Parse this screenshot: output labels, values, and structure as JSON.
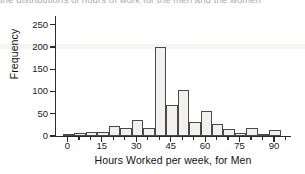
{
  "caption": "the distributions of hours of work for the men and the women",
  "chart_data": {
    "type": "bar",
    "title": "",
    "xlabel": "Hours Worked per week, for Men",
    "ylabel": "Frequency",
    "xlim": [
      -5,
      97
    ],
    "ylim": [
      0,
      265
    ],
    "grid": false,
    "legend": "none",
    "bin_width": 5,
    "x_ticks": [
      0,
      5,
      10,
      15,
      20,
      25,
      30,
      35,
      40,
      45,
      50,
      55,
      60,
      65,
      70,
      75,
      80,
      85,
      90,
      95
    ],
    "x_tick_labels": [
      "0",
      "15",
      "30",
      "45",
      "60",
      "75",
      "90"
    ],
    "x_major_ticks": [
      0,
      15,
      30,
      45,
      60,
      75,
      90
    ],
    "y_ticks": [
      0,
      50,
      100,
      150,
      200,
      250
    ],
    "y_tick_labels": [
      "0",
      "50",
      "100",
      "150",
      "200",
      "250"
    ],
    "bins": [
      {
        "start": -2,
        "end": 3,
        "value": 4
      },
      {
        "start": 3,
        "end": 8,
        "value": 7
      },
      {
        "start": 8,
        "end": 13,
        "value": 10
      },
      {
        "start": 13,
        "end": 18,
        "value": 10
      },
      {
        "start": 18,
        "end": 23,
        "value": 22
      },
      {
        "start": 23,
        "end": 28,
        "value": 19
      },
      {
        "start": 28,
        "end": 33,
        "value": 36
      },
      {
        "start": 33,
        "end": 38,
        "value": 19
      },
      {
        "start": 38,
        "end": 43,
        "value": 200
      },
      {
        "start": 43,
        "end": 48,
        "value": 69
      },
      {
        "start": 48,
        "end": 53,
        "value": 103
      },
      {
        "start": 53,
        "end": 58,
        "value": 32
      },
      {
        "start": 58,
        "end": 63,
        "value": 56
      },
      {
        "start": 63,
        "end": 68,
        "value": 26
      },
      {
        "start": 68,
        "end": 73,
        "value": 16
      },
      {
        "start": 73,
        "end": 78,
        "value": 6
      },
      {
        "start": 78,
        "end": 83,
        "value": 19
      },
      {
        "start": 83,
        "end": 88,
        "value": 4
      },
      {
        "start": 88,
        "end": 93,
        "value": 13
      }
    ],
    "categories": [
      "-2",
      "3",
      "8",
      "13",
      "18",
      "23",
      "28",
      "33",
      "38",
      "43",
      "48",
      "53",
      "58",
      "63",
      "68",
      "73",
      "78",
      "83",
      "88"
    ],
    "values": [
      4,
      7,
      10,
      10,
      22,
      19,
      36,
      19,
      200,
      69,
      103,
      32,
      56,
      26,
      16,
      6,
      19,
      4,
      13
    ],
    "colors": {
      "bar_fill": "#f2f1ef",
      "bar_edge": "#4a4a4a",
      "axis": "#2b2b2b",
      "text": "#1a1a1a"
    }
  }
}
